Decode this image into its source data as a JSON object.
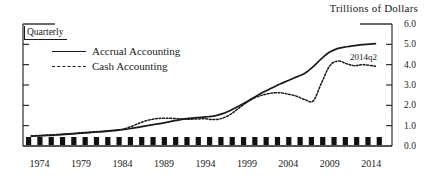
{
  "chart_data": {
    "type": "line",
    "title": "Trillions of Dollars",
    "subtitle": "Quarterly",
    "xlabel": "",
    "ylabel": "Trillions of Dollars",
    "xlim": [
      1972.0,
      2016.5
    ],
    "ylim": [
      0.0,
      6.0
    ],
    "grid": false,
    "legend_position": "inside-upper-left",
    "y_ticks": [
      "6.0",
      "5.0",
      "4.0",
      "3.0",
      "2.0",
      "1.0",
      "0.0"
    ],
    "y_tick_values": [
      6.0,
      5.0,
      4.0,
      3.0,
      2.0,
      1.0,
      0.0
    ],
    "x_ticks": [
      "1974",
      "1979",
      "1984",
      "1989",
      "1994",
      "1999",
      "2004",
      "2009",
      "2014"
    ],
    "x_tick_values": [
      1974,
      1979,
      1984,
      1989,
      1994,
      1999,
      2004,
      2009,
      2014
    ],
    "annotations": [
      {
        "text": "2014q2",
        "x": 2013.0,
        "y": 4.45
      }
    ],
    "series": [
      {
        "name": "Accrual Accounting",
        "style": "solid",
        "color": "#1a1a1a",
        "x": [
          1973,
          1974,
          1975,
          1976,
          1977,
          1978,
          1979,
          1980,
          1981,
          1982,
          1983,
          1984,
          1985,
          1986,
          1987,
          1988,
          1989,
          1990,
          1991,
          1992,
          1993,
          1994,
          1995,
          1996,
          1997,
          1998,
          1999,
          2000,
          2001,
          2002,
          2003,
          2004,
          2005,
          2006,
          2007,
          2008,
          2009,
          2010,
          2011,
          2012,
          2013,
          2014.5
        ],
        "values": [
          0.48,
          0.5,
          0.52,
          0.54,
          0.57,
          0.6,
          0.63,
          0.66,
          0.69,
          0.72,
          0.76,
          0.8,
          0.86,
          0.93,
          1.0,
          1.07,
          1.14,
          1.22,
          1.3,
          1.36,
          1.4,
          1.43,
          1.47,
          1.58,
          1.75,
          1.95,
          2.18,
          2.42,
          2.65,
          2.85,
          3.05,
          3.22,
          3.4,
          3.58,
          3.9,
          4.3,
          4.62,
          4.8,
          4.88,
          4.94,
          4.99,
          5.03
        ]
      },
      {
        "name": "Cash Accounting",
        "style": "dashed",
        "color": "#1a1a1a",
        "x": [
          1973,
          1974,
          1975,
          1976,
          1977,
          1978,
          1979,
          1980,
          1981,
          1982,
          1983,
          1984,
          1985,
          1986,
          1987,
          1988,
          1989,
          1990,
          1991,
          1992,
          1993,
          1994,
          1995,
          1996,
          1997,
          1998,
          1999,
          2000,
          2001,
          2002,
          2003,
          2004,
          2005,
          2006,
          2007,
          2008,
          2009,
          2010,
          2011,
          2012,
          2013,
          2014.5
        ],
        "values": [
          0.5,
          0.52,
          0.54,
          0.56,
          0.59,
          0.62,
          0.65,
          0.68,
          0.71,
          0.74,
          0.78,
          0.83,
          0.95,
          1.12,
          1.26,
          1.34,
          1.37,
          1.36,
          1.33,
          1.32,
          1.33,
          1.34,
          1.3,
          1.36,
          1.55,
          1.85,
          2.15,
          2.38,
          2.52,
          2.6,
          2.62,
          2.55,
          2.45,
          2.28,
          2.22,
          3.1,
          3.95,
          4.18,
          4.05,
          3.95,
          4.0,
          3.92
        ]
      }
    ]
  },
  "axis_ticks_marker": {
    "name": "bottom-tick-blocks",
    "count": 32
  }
}
